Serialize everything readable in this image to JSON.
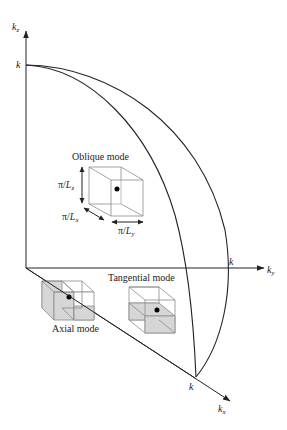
{
  "diagram": {
    "axes": {
      "kz": {
        "label": "k",
        "sub": "z"
      },
      "ky": {
        "label": "k",
        "sub": "y"
      },
      "kx": {
        "label": "k",
        "sub": "x"
      },
      "k_on_kz": "k",
      "k_on_ky": "k",
      "k_on_kx": "k"
    },
    "oblique": {
      "title": "Oblique mode",
      "dim_z": {
        "num": "π/",
        "L": "L",
        "sub": "z"
      },
      "dim_x": {
        "num": "π/",
        "L": "L",
        "sub": "x"
      },
      "dim_y": {
        "num": "π/",
        "L": "L",
        "sub": "y"
      }
    },
    "tangential": {
      "title": "Tangential mode"
    },
    "axial": {
      "title": "Axial mode"
    },
    "colors": {
      "line": "#222222",
      "box": "#8a8a8a",
      "shade": "#d6d6d6",
      "dot": "#000000"
    }
  }
}
